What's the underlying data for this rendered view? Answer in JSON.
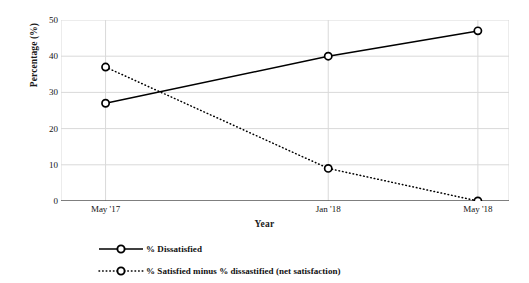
{
  "chart_data": {
    "type": "line",
    "title": "",
    "xlabel": "Year",
    "ylabel": "Percentage (%)",
    "categories": [
      "May '17",
      "Jan '18",
      "May '18"
    ],
    "series": [
      {
        "name": "% Dissatisfied",
        "values": [
          27,
          40,
          47
        ],
        "line_style": "solid",
        "marker": "circle-open",
        "color": "#000000"
      },
      {
        "name": "% Satisfied minus % dissastified (net satisfaction)",
        "values": [
          37,
          9,
          0
        ],
        "line_style": "dotted",
        "marker": "circle-open",
        "color": "#000000"
      }
    ],
    "ylim": [
      0,
      50
    ],
    "yticks": [
      0,
      10,
      20,
      30,
      40,
      50
    ],
    "ytick_labels": [
      "0",
      "10",
      "20",
      "30",
      "40",
      "50"
    ],
    "grid": "horizontal-and-vertical",
    "legend_position": "bottom",
    "background": "#ffffff",
    "grid_color": "#d9d9d9",
    "axis_color": "#4d4d4d"
  },
  "axes": {
    "y_title": "Percentage (%)",
    "x_title": "Year"
  },
  "legend": {
    "items": [
      {
        "label": "% Dissatisfied",
        "style": "solid"
      },
      {
        "label": "% Satisfied minus % dissastified (net satisfaction)",
        "style": "dotted"
      }
    ]
  }
}
